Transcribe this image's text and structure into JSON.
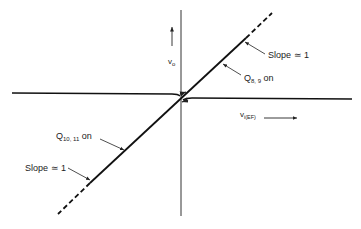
{
  "diagram": {
    "type": "transfer-characteristic",
    "colors": {
      "line": "#111111",
      "text": "#222222",
      "background": "#ffffff"
    },
    "axes": {
      "y_label": "v",
      "y_label_sub": "o",
      "x_label": "v",
      "x_label_sub": "i(EF)"
    },
    "annotations": {
      "upper_slope": "Slope ≃ 1",
      "upper_region_main": "Q",
      "upper_region_sub": "8, 9",
      "upper_region_suffix": " on",
      "lower_region_main": "Q",
      "lower_region_sub": "10, 11",
      "lower_region_suffix": " on",
      "lower_slope": "Slope ≃ 1"
    }
  }
}
